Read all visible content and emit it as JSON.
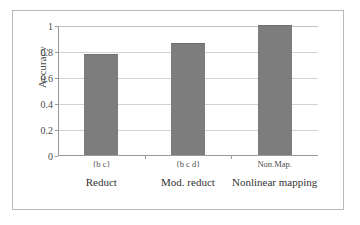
{
  "chart_data": {
    "type": "bar",
    "title": "",
    "subtitle": "",
    "xlabel": "",
    "ylabel": "Accuracy",
    "ylim": [
      0,
      1
    ],
    "yticks": [
      "0",
      "0.2",
      "0.4",
      "0.6",
      "0.8",
      "1"
    ],
    "ytick_values": [
      0,
      0.2,
      0.4,
      0.6,
      0.8,
      1
    ],
    "grid": true,
    "legend": false,
    "legend_position": "none",
    "categories": [
      "{b c}",
      "{b c d}",
      "Non.Map."
    ],
    "category_captions": [
      "Reduct",
      "Mod. reduct",
      "Nonlinear mapping"
    ],
    "values": [
      0.78,
      0.86,
      1.0
    ],
    "series": [
      {
        "name": "Accuracy",
        "values": [
          0.78,
          0.86,
          1.0
        ]
      }
    ],
    "bar_color": "#7d7d7d",
    "grid_color": "#d2d2d2",
    "axis_color": "#9a9a9a",
    "background_color": "#ffffff"
  }
}
